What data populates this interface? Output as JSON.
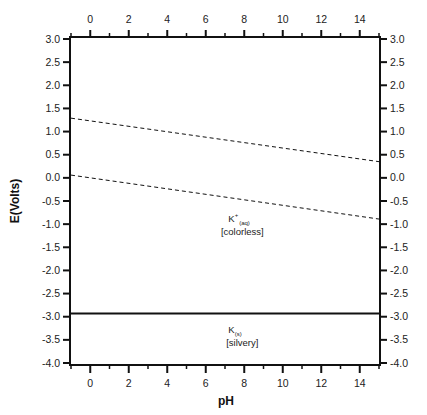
{
  "chart_data": {
    "type": "line",
    "title": "",
    "xlabel": "pH",
    "ylabel": "E(Volts)",
    "xlim": [
      -1,
      15
    ],
    "ylim": [
      -4.0,
      3.0
    ],
    "grid": false,
    "legend": null,
    "x_ticks_major": [
      0,
      2,
      4,
      6,
      8,
      10,
      12,
      14
    ],
    "x_ticks_minor": [
      -1,
      1,
      3,
      5,
      7,
      9,
      11,
      13,
      15
    ],
    "x_tick_labels": [
      "0",
      "2",
      "4",
      "6",
      "8",
      "10",
      "12",
      "14"
    ],
    "y_ticks": [
      3.0,
      2.5,
      2.0,
      1.5,
      1.0,
      0.5,
      0.0,
      -0.5,
      -1.0,
      -1.5,
      -2.0,
      -2.5,
      -3.0,
      -3.5,
      -4.0
    ],
    "y_tick_labels": [
      "3.0",
      "2.5",
      "2.0",
      "1.5",
      "1.0",
      "0.5",
      "0.0",
      "-0.5",
      "-1.0",
      "-1.5",
      "-2.0",
      "-2.5",
      "-3.0",
      "-3.5",
      "-4.0"
    ],
    "mirror_axes": {
      "top_x": true,
      "right_y": true
    },
    "series": [
      {
        "name": "O2/H2O boundary",
        "style": "dashed",
        "x": [
          -1,
          15
        ],
        "y": [
          1.29,
          0.35
        ]
      },
      {
        "name": "H+/H2 boundary",
        "style": "dashed",
        "x": [
          -1,
          15
        ],
        "y": [
          0.06,
          -0.89
        ]
      },
      {
        "name": "K+/K boundary",
        "style": "solid",
        "x": [
          -1,
          15
        ],
        "y": [
          -2.93,
          -2.93
        ]
      }
    ],
    "annotations": [
      {
        "species": "K",
        "superscript": "+",
        "subscript": "(aq)",
        "note": "[colorless]",
        "x": 7.9,
        "y": -0.95
      },
      {
        "species": "K",
        "superscript": "",
        "subscript": "(s)",
        "note": "[silvery]",
        "x": 7.9,
        "y": -3.35
      }
    ]
  }
}
